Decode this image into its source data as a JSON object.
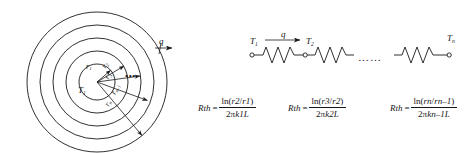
{
  "figure": {
    "stroke_color": "#1a1a1a",
    "background": "#ffffff",
    "left_diagram": {
      "name": "concentric-cylinder-cross-section",
      "center_label": "T",
      "center_sub": "1",
      "heat_flux_label": "q",
      "dots": "•••",
      "circle_count": 5,
      "radii_labels": [
        {
          "base": "r",
          "sub": "1"
        },
        {
          "base": "r",
          "sub": "2"
        },
        {
          "base": "r",
          "sub": "3"
        },
        {
          "base": "r",
          "sub": "n–1"
        },
        {
          "base": "r",
          "sub": "n"
        }
      ]
    },
    "right_diagram": {
      "name": "thermal-resistance-network",
      "heat_flux_label": "q",
      "dots": "……",
      "nodes": [
        {
          "base": "T",
          "sub": "1"
        },
        {
          "base": "T",
          "sub": "2"
        },
        {
          "base": "T",
          "sub": "n"
        }
      ],
      "resistor_count": 3
    },
    "equations": [
      {
        "lhs_base": "R",
        "lhs_sub": "th",
        "equals": "=",
        "numerator": {
          "fn": "ln(",
          "arg_a_base": "r",
          "arg_a_sub": "2",
          "slash": "/",
          "arg_b_base": "r",
          "arg_b_sub": "1",
          "close": ")"
        },
        "denominator": {
          "coef": "2",
          "pi": "π",
          "k_base": "k",
          "k_sub": "1",
          "length": "L"
        }
      },
      {
        "lhs_base": "R",
        "lhs_sub": "th",
        "equals": "=",
        "numerator": {
          "fn": "ln(",
          "arg_a_base": "r",
          "arg_a_sub": "3",
          "slash": "/",
          "arg_b_base": "r",
          "arg_b_sub": "2",
          "close": ")"
        },
        "denominator": {
          "coef": "2",
          "pi": "π",
          "k_base": "k",
          "k_sub": "2",
          "length": "L"
        }
      },
      {
        "lhs_base": "R",
        "lhs_sub": "th",
        "equals": "=",
        "numerator": {
          "fn": "ln(",
          "arg_a_base": "r",
          "arg_a_sub": "n",
          "slash": "/",
          "arg_b_base": "r",
          "arg_b_sub": "n–1",
          "close": ")"
        },
        "denominator": {
          "coef": "2",
          "pi": "π",
          "k_base": "k",
          "k_sub": "n–1",
          "length": "L"
        }
      }
    ]
  }
}
